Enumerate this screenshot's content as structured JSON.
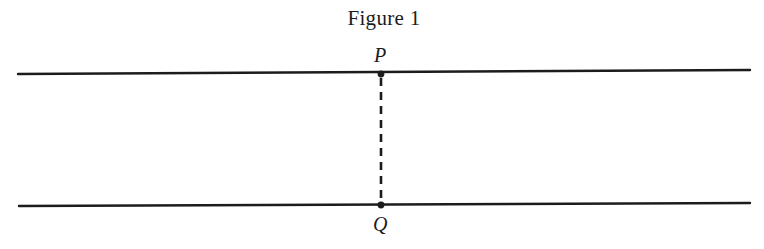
{
  "figure": {
    "title": "Figure 1",
    "colors": {
      "ink": "#1c1c1c",
      "background": "#ffffff"
    }
  },
  "diagram": {
    "lines": [
      {
        "name": "top-line",
        "x1": 18,
        "y1": 74,
        "x2": 750,
        "y2": 70,
        "style": "solid"
      },
      {
        "name": "bottom-line",
        "x1": 19,
        "y1": 206,
        "x2": 750,
        "y2": 203,
        "style": "solid"
      },
      {
        "name": "segment-pq",
        "x1": 381,
        "y1": 74,
        "x2": 381,
        "y2": 205,
        "style": "dashed"
      }
    ],
    "points": [
      {
        "label": "P",
        "x": 381,
        "y": 74
      },
      {
        "label": "Q",
        "x": 381,
        "y": 205
      }
    ]
  }
}
